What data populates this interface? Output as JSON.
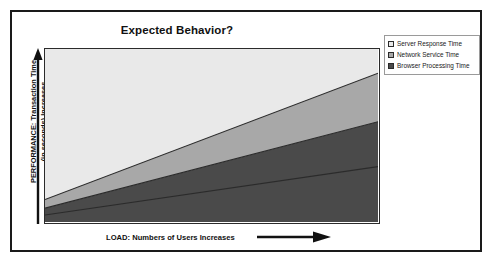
{
  "chart_data": {
    "type": "area",
    "title": "Expected Behavior?",
    "xlabel": "LOAD: Numbers of Users Increases",
    "ylabel_line1": "PERFORMANCE: Transaction Time",
    "ylabel_line2": "(in seconds) Increases",
    "stacked": true,
    "grid": false,
    "legend_position": "top-right",
    "xlim": [
      0,
      100
    ],
    "ylim": [
      0,
      100
    ],
    "x": [
      0,
      100
    ],
    "series": [
      {
        "name": "Browser Processing Time",
        "values": [
          4,
          32
        ],
        "color": "#4a4a4a",
        "legend_index": 2
      },
      {
        "name": "Network Service Time",
        "values": [
          8,
          58
        ],
        "color": "#a8a8a8",
        "legend_index": 1
      },
      {
        "name": "Server Response Time",
        "values": [
          13,
          86
        ],
        "color": "#e9e9e9",
        "legend_index": 0
      }
    ],
    "legend_entries": [
      {
        "label": "Server Response Time",
        "color": "#e9e9e9"
      },
      {
        "label": "Network Service Time",
        "color": "#a8a8a8"
      },
      {
        "label": "Browser Processing Time",
        "color": "#4a4a4a"
      }
    ],
    "annotations": {
      "x_axis_arrow": "right-arrow-icon",
      "y_axis_arrow": "up-arrow-icon"
    },
    "colors": {
      "frame": "#1a1a1a",
      "plot_border": "#2b2b2b",
      "boundary_line": "#2b2b2b",
      "text": "#111111",
      "background": "#ffffff"
    }
  }
}
